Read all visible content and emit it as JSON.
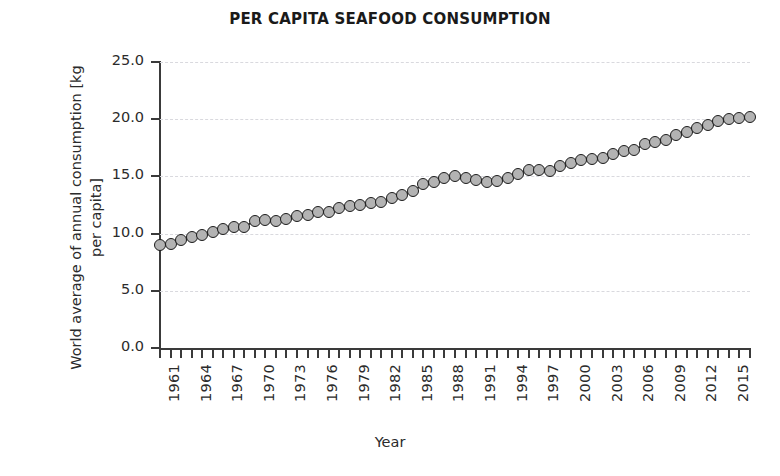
{
  "chart_data": {
    "type": "line",
    "title": "PER CAPITA SEAFOOD CONSUMPTION",
    "xlabel": "Year",
    "ylabel": "World average of annual consumption [kg per capita]",
    "ylim": [
      0.0,
      25.0
    ],
    "xlim": [
      1961,
      2017
    ],
    "ytick_labels": [
      "0.0",
      "5.0",
      "10.0",
      "15.0",
      "20.0",
      "25.0"
    ],
    "ytick_values": [
      0.0,
      5.0,
      10.0,
      15.0,
      20.0,
      25.0
    ],
    "xtick_labels": [
      "1961",
      "1964",
      "1967",
      "1970",
      "1973",
      "1976",
      "1979",
      "1982",
      "1985",
      "1988",
      "1991",
      "1994",
      "1997",
      "2000",
      "2003",
      "2006",
      "2009",
      "2012",
      "2015"
    ],
    "xtick_values": [
      1961,
      1964,
      1967,
      1970,
      1973,
      1976,
      1979,
      1982,
      1985,
      1988,
      1991,
      1994,
      1997,
      2000,
      2003,
      2006,
      2009,
      2012,
      2015
    ],
    "grid": true,
    "grid_axis": "y",
    "legend": false,
    "marker": "circle",
    "marker_face_color": "#b3b3b3",
    "marker_edge_color": "#1c1c1c",
    "line_color": "#1c1c1c",
    "x": [
      1961,
      1962,
      1963,
      1964,
      1965,
      1966,
      1967,
      1968,
      1969,
      1970,
      1971,
      1972,
      1973,
      1974,
      1975,
      1976,
      1977,
      1978,
      1979,
      1980,
      1981,
      1982,
      1983,
      1984,
      1985,
      1986,
      1987,
      1988,
      1989,
      1990,
      1991,
      1992,
      1993,
      1994,
      1995,
      1996,
      1997,
      1998,
      1999,
      2000,
      2001,
      2002,
      2003,
      2004,
      2005,
      2006,
      2007,
      2008,
      2009,
      2010,
      2011,
      2012,
      2013,
      2014,
      2015,
      2016,
      2017
    ],
    "values": [
      9.0,
      9.1,
      9.4,
      9.7,
      9.9,
      10.1,
      10.4,
      10.6,
      10.6,
      11.1,
      11.2,
      11.1,
      11.3,
      11.5,
      11.6,
      11.9,
      11.9,
      12.2,
      12.4,
      12.5,
      12.7,
      12.8,
      13.1,
      13.4,
      13.7,
      14.3,
      14.5,
      14.9,
      15.0,
      14.9,
      14.7,
      14.5,
      14.6,
      14.9,
      15.2,
      15.6,
      15.6,
      15.5,
      15.9,
      16.2,
      16.4,
      16.5,
      16.6,
      17.0,
      17.2,
      17.3,
      17.8,
      18.0,
      18.2,
      18.6,
      18.9,
      19.2,
      19.5,
      19.8,
      20.0,
      20.1,
      20.2
    ]
  }
}
